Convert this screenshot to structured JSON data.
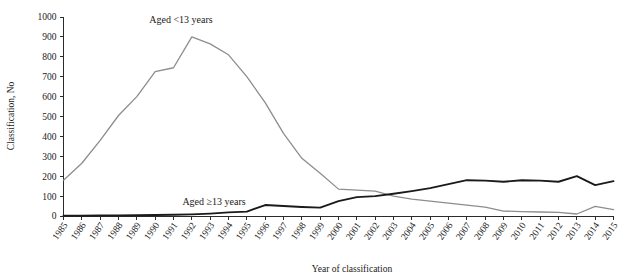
{
  "chart_data": {
    "type": "line",
    "title": "",
    "xlabel": "Year of classification",
    "ylabel": "Classification, No",
    "grid": false,
    "legend_position": "inline-annotation",
    "ylim": [
      0,
      1000
    ],
    "yticks": [
      0,
      100,
      200,
      300,
      400,
      500,
      600,
      700,
      800,
      900,
      1000
    ],
    "ytick_labels": [
      "0",
      "100",
      "200",
      "300",
      "400",
      "500",
      "600",
      "700",
      "800",
      "900",
      "1000"
    ],
    "categories": [
      "1985",
      "1986",
      "1987",
      "1988",
      "1989",
      "1990",
      "1991",
      "1992",
      "1993",
      "1994",
      "1995",
      "1996",
      "1997",
      "1998",
      "1999",
      "2000",
      "2001",
      "2002",
      "2003",
      "2004",
      "2005",
      "2006",
      "2007",
      "2008",
      "2009",
      "2010",
      "2011",
      "2012",
      "2013",
      "2014",
      "2015"
    ],
    "x": [
      1985,
      1986,
      1987,
      1988,
      1989,
      1990,
      1991,
      1992,
      1993,
      1994,
      1995,
      1996,
      1997,
      1998,
      1999,
      2000,
      2001,
      2002,
      2003,
      2004,
      2005,
      2006,
      2007,
      2008,
      2009,
      2010,
      2011,
      2012,
      2013,
      2014,
      2015
    ],
    "series": [
      {
        "name": "Aged <13 years",
        "color": "#8d8d8d",
        "annotation": "Aged <13 years",
        "values": [
          180,
          265,
          380,
          505,
          600,
          725,
          745,
          900,
          865,
          810,
          700,
          570,
          415,
          290,
          215,
          135,
          130,
          125,
          100,
          85,
          75,
          65,
          55,
          45,
          25,
          22,
          20,
          18,
          10,
          48,
          32
        ]
      },
      {
        "name": "Aged ≥13 years",
        "color": "#1a1a1a",
        "annotation": "Aged ≥13 years",
        "values": [
          2,
          2,
          3,
          3,
          4,
          5,
          6,
          8,
          12,
          18,
          22,
          55,
          50,
          45,
          42,
          75,
          95,
          100,
          112,
          125,
          140,
          160,
          180,
          178,
          172,
          180,
          178,
          172,
          200,
          155,
          175
        ]
      }
    ]
  },
  "axes": {
    "y_axis_title": "Classification, No",
    "x_axis_title": "Year of classification"
  }
}
